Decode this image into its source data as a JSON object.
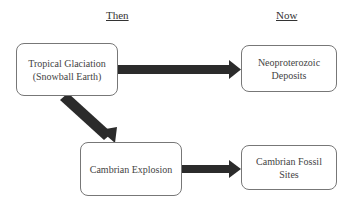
{
  "headings": {
    "then": "Then",
    "now": "Now"
  },
  "nodes": [
    {
      "id": "tropical-glaciation",
      "label": "Tropical Glaciation\n(Snowball Earth)",
      "line1": "Tropical Glaciation",
      "line2": "(Snowball Earth)"
    },
    {
      "id": "neoproterozoic-deposits",
      "line1": "Neoproterozoic",
      "line2": "Deposits"
    },
    {
      "id": "cambrian-explosion",
      "line1": "Cambrian Explosion"
    },
    {
      "id": "cambrian-fossil-sites",
      "line1": "Cambrian Fossil",
      "line2": "Sites"
    }
  ],
  "edges": [
    {
      "from": "tropical-glaciation",
      "to": "neoproterozoic-deposits"
    },
    {
      "from": "tropical-glaciation",
      "to": "cambrian-explosion"
    },
    {
      "from": "cambrian-explosion",
      "to": "cambrian-fossil-sites"
    }
  ],
  "colors": {
    "arrow": "#2b2b2b",
    "border": "#777777",
    "text": "#444444"
  }
}
